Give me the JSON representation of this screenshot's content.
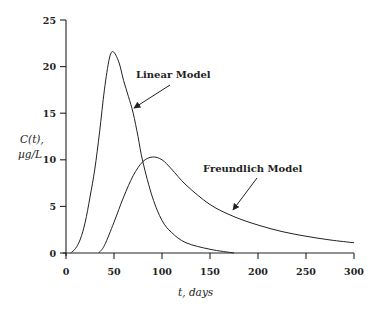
{
  "chart_data": {
    "type": "line",
    "title": "",
    "xlabel": "t, days",
    "ylabel_line1": "C(t),",
    "ylabel_line2": "µg/L",
    "xlim": [
      0,
      300
    ],
    "ylim": [
      0,
      25
    ],
    "grid": false,
    "legend": "none (inline annotations with arrows)",
    "x_ticks": [
      0,
      50,
      100,
      150,
      200,
      250,
      300
    ],
    "y_ticks": [
      0,
      5,
      10,
      15,
      20,
      25
    ],
    "series": [
      {
        "name": "Linear Model",
        "t": [
          5,
          10,
          15,
          20,
          25,
          30,
          35,
          40,
          45,
          49,
          55,
          60,
          65,
          70,
          75,
          80,
          90,
          100,
          110,
          125,
          150,
          175
        ],
        "C": [
          0,
          0.5,
          1.5,
          3.3,
          6,
          9,
          13,
          17.5,
          20.8,
          21.6,
          20.5,
          18.5,
          16.8,
          15,
          12.5,
          9.8,
          6,
          3.5,
          2.2,
          1.1,
          0.4,
          0
        ]
      },
      {
        "name": "Freundlich Model",
        "t": [
          34,
          40,
          50,
          60,
          70,
          80,
          90,
          100,
          110,
          125,
          150,
          175,
          200,
          225,
          250,
          275,
          300
        ],
        "C": [
          0,
          0.8,
          3.3,
          6,
          8.3,
          9.8,
          10.3,
          10,
          9,
          7.3,
          5.2,
          3.9,
          3,
          2.3,
          1.8,
          1.4,
          1.1
        ]
      }
    ],
    "annotations": [
      {
        "text": "Linear Model",
        "arrow_to_t": 70,
        "arrow_to_C": 15.5
      },
      {
        "text": "Freundlich Model",
        "arrow_to_t": 173,
        "arrow_to_C": 4.5
      }
    ]
  }
}
